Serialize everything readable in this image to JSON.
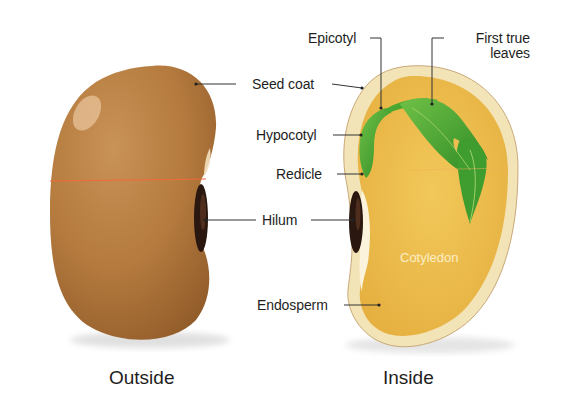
{
  "diagram": {
    "colors": {
      "seed_coat_outer": "#b57a3f",
      "seed_coat_inner": "#f3e4b8",
      "cotyledon": "#ecbc4c",
      "embryo_green": "#4aa832",
      "hilum": "#2a1810",
      "leader_line": "#333333",
      "equator_line": "#f06a3a"
    },
    "panels": [
      {
        "id": "outside",
        "caption": "Outside"
      },
      {
        "id": "inside",
        "caption": "Inside"
      }
    ],
    "labels": {
      "epicotyl": "Epicotyl",
      "first_true_leaves_line1": "First true",
      "first_true_leaves_line2": "leaves",
      "seed_coat": "Seed coat",
      "hypocotyl": "Hypocotyl",
      "redicle": "Redicle",
      "hilum": "Hilum",
      "endosperm": "Endosperm",
      "cotyledon": "Cotyledon"
    }
  }
}
